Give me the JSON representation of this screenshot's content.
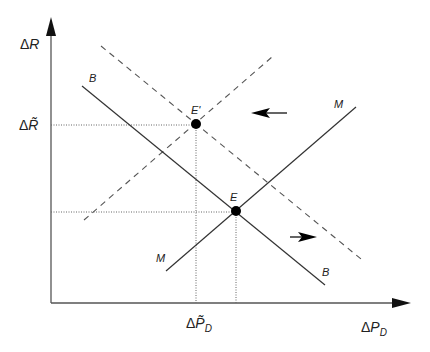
{
  "diagram": {
    "type": "economics-equilibrium-shift",
    "axes": {
      "y_label_delta": "Δ",
      "y_label_var": "R",
      "x_label_delta": "Δ",
      "x_label_var": "P",
      "x_label_sub": "D"
    },
    "ticks": {
      "y_tick_delta": "Δ",
      "y_tick_var": "R̃",
      "x_tick_delta": "Δ",
      "x_tick_var": "P̃",
      "x_tick_sub": "D"
    },
    "curves": [
      {
        "name": "B",
        "style": "solid",
        "label": "B"
      },
      {
        "name": "B",
        "style": "solid",
        "label": "B",
        "position": "end"
      },
      {
        "name": "M",
        "style": "solid",
        "label": "M"
      },
      {
        "name": "M",
        "style": "solid",
        "label": "M",
        "position": "end"
      }
    ],
    "shifted_curves": [
      {
        "name": "B-shifted",
        "style": "dashed"
      },
      {
        "name": "M-shifted",
        "style": "dashed"
      }
    ],
    "points": [
      {
        "label": "E'",
        "description": "new equilibrium"
      },
      {
        "label": "E",
        "description": "initial equilibrium"
      }
    ],
    "arrows": [
      {
        "direction": "left",
        "meaning": "M shifts left"
      },
      {
        "direction": "right",
        "meaning": "B shifts right"
      }
    ],
    "colors": {
      "line": "#333333",
      "axis": "#444444",
      "point": "#000000"
    }
  }
}
